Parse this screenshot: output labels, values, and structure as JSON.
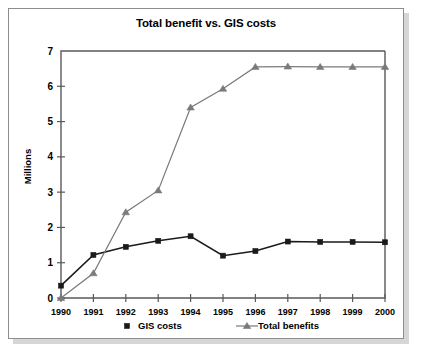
{
  "chart_data": {
    "type": "line",
    "title": "Total benefit vs. GIS costs",
    "xlabel": "",
    "ylabel": "Millions",
    "categories": [
      "1990",
      "1991",
      "1992",
      "1993",
      "1994",
      "1995",
      "1996",
      "1997",
      "1998",
      "1999",
      "2000"
    ],
    "ylim": [
      0,
      7
    ],
    "yticks": [
      "0",
      "1",
      "2",
      "3",
      "4",
      "5",
      "6",
      "7"
    ],
    "grid": false,
    "legend_position": "bottom",
    "series": [
      {
        "name": "GIS costs",
        "marker": "square",
        "color": "#1a1a1a",
        "values": [
          0.35,
          1.22,
          1.45,
          1.62,
          1.75,
          1.2,
          1.33,
          1.6,
          1.59,
          1.59,
          1.58
        ]
      },
      {
        "name": "Total benefits",
        "marker": "triangle",
        "color": "#7a7a7a",
        "values": [
          0.0,
          0.7,
          2.43,
          3.05,
          5.4,
          5.93,
          6.55,
          6.56,
          6.55,
          6.55,
          6.55
        ]
      }
    ]
  },
  "legend": {
    "items": [
      {
        "label": "GIS costs"
      },
      {
        "label": "Total benefits"
      }
    ]
  }
}
